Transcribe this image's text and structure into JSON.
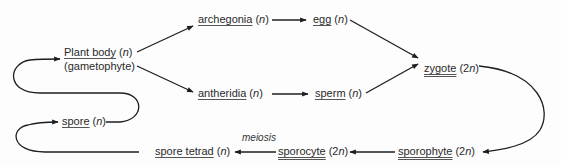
{
  "diagram": {
    "type": "plant life cycle",
    "nodes": {
      "plant_body": {
        "label": "Plant body",
        "ploidy_open": "(",
        "ploidy": "n",
        "ploidy_close": ")",
        "sub": "(gametophyte)"
      },
      "archegonia": {
        "label": "archegonia",
        "ploidy_open": "(",
        "ploidy": "n",
        "ploidy_close": ")"
      },
      "egg": {
        "label": "egg",
        "ploidy_open": "(",
        "ploidy": "n",
        "ploidy_close": ")"
      },
      "antheridia": {
        "label": "antheridia",
        "ploidy_open": "(",
        "ploidy": "n",
        "ploidy_close": ")"
      },
      "sperm": {
        "label": "sperm",
        "ploidy_open": "(",
        "ploidy": "n",
        "ploidy_close": ")"
      },
      "zygote": {
        "label": "zygote",
        "ploidy_open": "(2",
        "ploidy": "n",
        "ploidy_close": ")"
      },
      "sporophyte": {
        "label": "sporophyte",
        "ploidy_open": "(2",
        "ploidy": "n",
        "ploidy_close": ")"
      },
      "sporocyte": {
        "label": "sporocyte",
        "ploidy_open": "(2",
        "ploidy": "n",
        "ploidy_close": ")"
      },
      "spore_tetrad": {
        "label": "spore tetrad",
        "ploidy_open": "(",
        "ploidy": "n",
        "ploidy_close": ")"
      },
      "spore": {
        "label": "spore",
        "ploidy_open": "(",
        "ploidy": "n",
        "ploidy_close": ")"
      }
    },
    "edge_labels": {
      "meiosis": "meiosis"
    },
    "edges": [
      [
        "Plant body",
        "archegonia"
      ],
      [
        "Plant body",
        "antheridia"
      ],
      [
        "archegonia",
        "egg"
      ],
      [
        "antheridia",
        "sperm"
      ],
      [
        "egg",
        "zygote"
      ],
      [
        "sperm",
        "zygote"
      ],
      [
        "zygote",
        "sporophyte"
      ],
      [
        "sporophyte",
        "sporocyte"
      ],
      [
        "sporocyte",
        "spore tetrad"
      ],
      [
        "spore tetrad",
        "spore"
      ],
      [
        "spore",
        "Plant body"
      ]
    ],
    "colors": {
      "line": "#1e1e1e",
      "text": "#2a2a2a",
      "background": "#fdfdfd"
    }
  }
}
